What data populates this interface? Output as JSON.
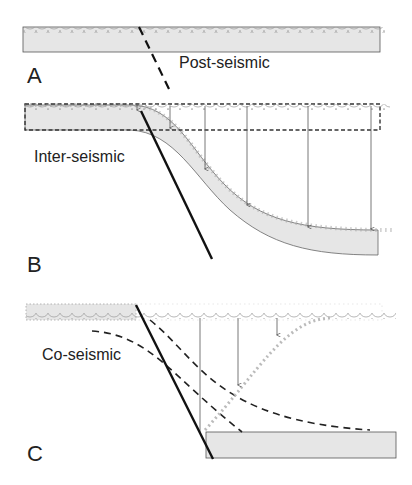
{
  "panels": [
    {
      "id": "A",
      "letter": "A",
      "phase": "Post-seismic"
    },
    {
      "id": "B",
      "letter": "B",
      "phase": "Inter-seismic"
    },
    {
      "id": "C",
      "letter": "C",
      "phase": "Co-seismic"
    }
  ],
  "colors": {
    "fill": "#e6e6e6",
    "outline": "#555555",
    "fault": "#111111",
    "arrow": "#555555",
    "scallop": "#999999"
  }
}
